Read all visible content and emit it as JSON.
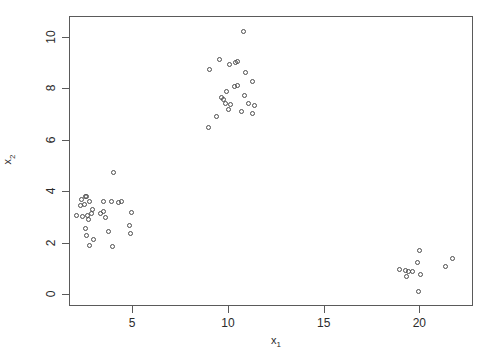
{
  "chart_data": {
    "type": "scatter",
    "title": "",
    "xlabel": "x1",
    "ylabel": "x2",
    "xlabel_base": "x",
    "xlabel_sub": "1",
    "ylabel_base": "x",
    "ylabel_sub": "2",
    "xlim": [
      1.7,
      22.8
    ],
    "ylim": [
      -0.45,
      10.8
    ],
    "xticks": [
      5,
      10,
      15,
      20
    ],
    "xtick_labels": [
      "5",
      "10",
      "15",
      "20"
    ],
    "yticks": [
      0,
      2,
      4,
      6,
      8,
      10
    ],
    "ytick_labels": [
      "0",
      "2",
      "4",
      "6",
      "8",
      "10"
    ],
    "grid": false,
    "legend": false,
    "marker": "open-circle",
    "marker_color": "#4d4d4d",
    "frame_color": "#5a5a5a",
    "background": "#ffffff",
    "n_points": 61,
    "clusters": [
      {
        "name": "cluster-low-left",
        "n": 28
      },
      {
        "name": "cluster-upper-middle",
        "n": 22
      },
      {
        "name": "cluster-lower-right",
        "n": 11
      }
    ],
    "points": [
      [
        2.35,
        3.7
      ],
      [
        2.55,
        3.8
      ],
      [
        2.62,
        3.78
      ],
      [
        2.3,
        3.45
      ],
      [
        2.52,
        3.5
      ],
      [
        2.78,
        3.62
      ],
      [
        2.1,
        3.05
      ],
      [
        2.42,
        3.02
      ],
      [
        2.68,
        3.08
      ],
      [
        2.88,
        3.12
      ],
      [
        2.95,
        3.28
      ],
      [
        2.72,
        2.92
      ],
      [
        3.35,
        3.15
      ],
      [
        3.52,
        3.22
      ],
      [
        3.6,
        3.0
      ],
      [
        3.92,
        3.62
      ],
      [
        4.28,
        3.58
      ],
      [
        4.42,
        3.62
      ],
      [
        3.48,
        3.6
      ],
      [
        4.95,
        3.18
      ],
      [
        2.58,
        2.55
      ],
      [
        2.62,
        2.3
      ],
      [
        2.98,
        2.12
      ],
      [
        2.78,
        1.88
      ],
      [
        3.78,
        2.45
      ],
      [
        3.95,
        1.85
      ],
      [
        4.88,
        2.68
      ],
      [
        4.9,
        2.38
      ],
      [
        4.02,
        4.72
      ],
      [
        10.8,
        10.2
      ],
      [
        9.55,
        9.1
      ],
      [
        10.1,
        8.92
      ],
      [
        10.42,
        9.0
      ],
      [
        10.48,
        9.02
      ],
      [
        9.05,
        8.72
      ],
      [
        10.92,
        8.62
      ],
      [
        11.3,
        8.25
      ],
      [
        10.35,
        8.08
      ],
      [
        10.52,
        8.1
      ],
      [
        9.68,
        7.62
      ],
      [
        9.78,
        7.58
      ],
      [
        9.85,
        7.42
      ],
      [
        10.15,
        7.38
      ],
      [
        10.05,
        7.18
      ],
      [
        11.05,
        7.4
      ],
      [
        11.38,
        7.32
      ],
      [
        10.72,
        7.08
      ],
      [
        11.28,
        7.02
      ],
      [
        9.38,
        6.92
      ],
      [
        8.98,
        6.48
      ],
      [
        10.88,
        7.72
      ],
      [
        9.92,
        7.88
      ],
      [
        20.0,
        1.7
      ],
      [
        19.92,
        1.25
      ],
      [
        18.98,
        0.98
      ],
      [
        19.28,
        0.92
      ],
      [
        19.45,
        0.9
      ],
      [
        19.62,
        0.88
      ],
      [
        20.05,
        0.78
      ],
      [
        19.35,
        0.68
      ],
      [
        19.95,
        0.12
      ],
      [
        21.35,
        1.1
      ],
      [
        21.75,
        1.38
      ]
    ]
  }
}
